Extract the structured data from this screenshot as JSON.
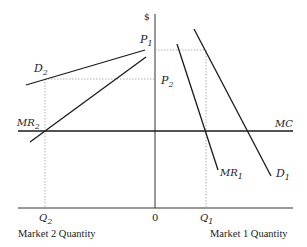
{
  "diagram": {
    "y_axis_label": "$",
    "origin_label": "0",
    "x_axis_left_label": "Market 2 Quantity",
    "x_axis_right_label": "Market 1 Quantity",
    "curves": {
      "D1": {
        "main": "D",
        "sub": "1"
      },
      "MR1": {
        "main": "MR",
        "sub": "1"
      },
      "D2": {
        "main": "D",
        "sub": "2"
      },
      "MR2": {
        "main": "MR",
        "sub": "2"
      },
      "MC": {
        "main": "MC",
        "sub": ""
      }
    },
    "prices": {
      "P1": {
        "main": "P",
        "sub": "1"
      },
      "P2": {
        "main": "P",
        "sub": "2"
      }
    },
    "quantities": {
      "Q1": {
        "main": "Q",
        "sub": "1"
      },
      "Q2": {
        "main": "Q",
        "sub": "2"
      }
    }
  }
}
